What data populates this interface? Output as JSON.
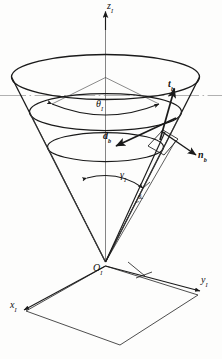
{
  "figure": {
    "type": "technical-line-diagram",
    "background_color": "#fdfdfc",
    "line_color": "#1a1a1a",
    "reference_line_color": "#9a9a9a"
  },
  "axes": {
    "z": {
      "label": "z",
      "subscript": "I",
      "direction": "up",
      "arrow": true
    },
    "y": {
      "label": "y",
      "subscript": "I",
      "direction": "right-down",
      "arrow": true
    },
    "x": {
      "label": "x",
      "subscript": "I",
      "direction": "left-down",
      "arrow": true
    },
    "origin": {
      "label": "O",
      "subscript": "I"
    }
  },
  "angles": [
    {
      "name": "cone-half-angle",
      "label": "θ",
      "subscript": "I",
      "arrow_style": "double-headed-arc"
    },
    {
      "name": "slant-angle",
      "label": "γ",
      "subscript": "I",
      "arrow_style": "single-headed-arc"
    }
  ],
  "dimensions": [
    {
      "name": "slant-length",
      "label": "w",
      "subscript": "I"
    }
  ],
  "vectors": [
    {
      "name": "tangent-vector",
      "label": "t",
      "subscript": "b",
      "bold": true,
      "direction": "up-right"
    },
    {
      "name": "direction-vector",
      "label": "d",
      "subscript": "b",
      "bold": true,
      "direction": "down-left"
    },
    {
      "name": "normal-vector",
      "label": "n",
      "subscript": "b",
      "bold": true,
      "direction": "down-right"
    }
  ],
  "shapes": {
    "cone": {
      "apex": "origin",
      "opening": "upward",
      "rim_ellipses": 3
    },
    "ground_plane": {
      "shape": "parallelogram",
      "plane": "x-y"
    },
    "reference_line": {
      "style": "dash-dot",
      "orientation": "horizontal"
    }
  }
}
